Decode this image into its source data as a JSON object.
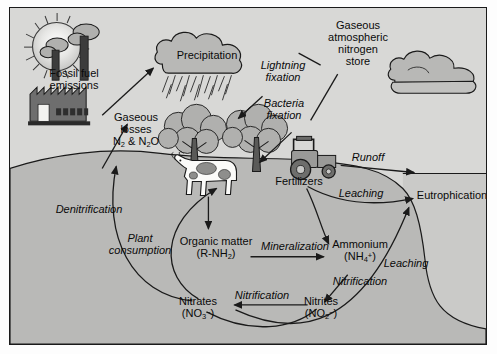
{
  "diagram": {
    "colors": {
      "sky": "#d8d8d6",
      "soil": "#b9b9b7",
      "water": "#cacac8",
      "cloud_fill": "#b8b8b6",
      "tree_canopy": "#b0b0ae",
      "outline": "#1a1a1a",
      "factory": "#6e6e6e",
      "tractor": "#8a8a88",
      "sun": "#e8e8e6"
    },
    "labels": {
      "fossil_fuel": "Fossil fuel\nemissions",
      "fossil_fuel_l1": "Fossil fuel",
      "fossil_fuel_l2": "emissions",
      "precipitation": "Precipitation",
      "gaseous_losses_l1": "Gaseous",
      "gaseous_losses_l2": "losses",
      "gaseous_losses_l3": "N₂ & N₂O",
      "lightning_l1": "Lightning",
      "lightning_l2": "fixation",
      "bacteria_l1": "Bacteria",
      "bacteria_l2": "fixation",
      "atmos_store_l1": "Gaseous",
      "atmos_store_l2": "atmospheric",
      "atmos_store_l3": "nitrogen",
      "atmos_store_l4": "store",
      "runoff": "Runoff",
      "fertilizers": "Fertilizers",
      "leaching_upper": "Leaching",
      "leaching_lower": "Leaching",
      "eutrophication": "Eutrophication",
      "denitrification": "Denitrification",
      "plant_consumption_l1": "Plant",
      "plant_consumption_l2": "consumption",
      "organic_matter_l1": "Organic matter",
      "organic_matter_l2": "(R-NH₂)",
      "mineralization": "Mineralization",
      "ammonium_l1": "Ammonium",
      "ammonium_l2": "(NH₄⁺)",
      "nitrification_right": "Nitrification",
      "nitrites_l1": "Nitrites",
      "nitrites_l2": "(NO₂⁻)",
      "nitrification_mid": "Nitrification",
      "nitrates_l1": "Nitrates",
      "nitrates_l2": "(NO₃⁻)"
    },
    "icons": {
      "sun": "sun-icon",
      "factory": "factory-icon",
      "rain_cloud": "rain-cloud-icon",
      "cloud": "cloud-icon",
      "tree": "tree-icon",
      "cow": "cow-icon",
      "tractor": "tractor-icon"
    }
  }
}
